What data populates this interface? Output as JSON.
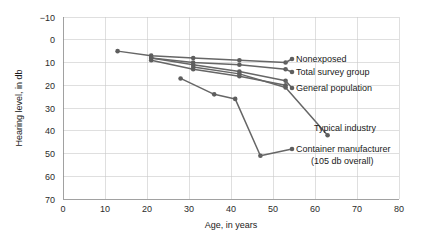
{
  "chart_data": {
    "type": "line",
    "title": "",
    "subtitle": "",
    "xlabel": "Age, in years",
    "ylabel": "Hearing level, in db",
    "xlim": [
      0,
      80
    ],
    "ylim": [
      -10,
      70
    ],
    "y_inverted": true,
    "xticks": [
      0,
      10,
      20,
      30,
      40,
      50,
      60,
      70,
      80
    ],
    "xtick_labels": [
      "0",
      "10",
      "20",
      "30",
      "40",
      "50",
      "60",
      "70",
      "80"
    ],
    "yticks": [
      -10,
      0,
      10,
      20,
      30,
      40,
      50,
      60,
      70
    ],
    "ytick_labels": [
      "−10",
      "0",
      "10",
      "20",
      "30",
      "40",
      "50",
      "60",
      "70"
    ],
    "grid": true,
    "legend_position": "inline-right-of-series-end",
    "line_color": "#666666",
    "marker_color": "#5e5e5e",
    "grid_color": "#c9c9c9",
    "axis_color": "#8a8a8a",
    "series": [
      {
        "name": "Nonexposed",
        "label": "Nonexposed",
        "x": [
          13,
          21,
          31,
          42,
          53
        ],
        "y": [
          5,
          7,
          8,
          9,
          10
        ],
        "label_x": 65,
        "label_y": 8.5
      },
      {
        "name": "Total survey group",
        "label": "Total survey group",
        "x": [
          21,
          31,
          42,
          53
        ],
        "y": [
          8,
          10,
          11,
          13
        ],
        "label_x": 65,
        "label_y": 13
      },
      {
        "name": "General population",
        "label": "General population",
        "x": [
          21,
          31,
          42,
          53
        ],
        "y": [
          8,
          11,
          14,
          18
        ],
        "label_x": 65,
        "label_y": 19
      },
      {
        "name": "General population secondary",
        "label": "",
        "x": [
          21,
          31,
          42,
          53
        ],
        "y": [
          9,
          13,
          16,
          20
        ],
        "label_x": null,
        "label_y": null
      },
      {
        "name": "Typical industry",
        "label": "Typical industry",
        "x": [
          31,
          42,
          53,
          63
        ],
        "y": [
          12,
          15,
          21,
          42
        ],
        "label_x": 71,
        "label_y": 38
      },
      {
        "name": "Container manufacturer",
        "label": "Container manufacturer",
        "label_line2": "(105 db overall)",
        "x": [
          28,
          36,
          41,
          47
        ],
        "y": [
          17,
          24,
          26,
          51
        ],
        "label_x": 65,
        "label_y": 49
      }
    ],
    "annotations": [
      {
        "text": "Nonexposed",
        "x": 65,
        "y": 8.5
      },
      {
        "text": "Total survey group",
        "x": 65,
        "y": 13
      },
      {
        "text": "General population",
        "x": 65,
        "y": 19
      },
      {
        "text": "Typical industry",
        "x": 71,
        "y": 38
      },
      {
        "text": "Container manufacturer",
        "x": 65,
        "y": 49
      },
      {
        "text": "(105 db overall)",
        "x": 70,
        "y": 55
      }
    ]
  }
}
